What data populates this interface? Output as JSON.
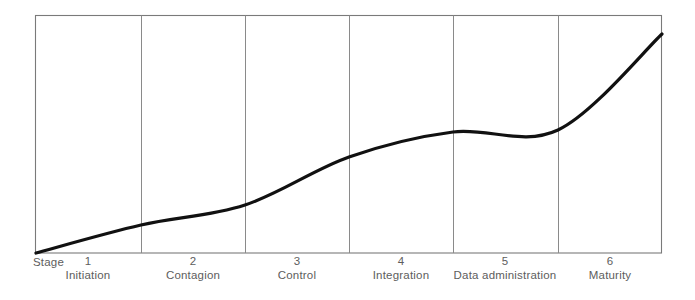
{
  "chart_data": {
    "type": "line",
    "title": "",
    "subtitle": "",
    "xlabel": "Stage",
    "ylabel": "",
    "grid": "vertical-stage-dividers",
    "legend": "none",
    "axis_label_prefix": "Stage",
    "categories": [
      "Initiation",
      "Contagion",
      "Control",
      "Integration",
      "Data administration",
      "Maturity"
    ],
    "stage_numbers": [
      "1",
      "2",
      "3",
      "4",
      "5",
      "6"
    ],
    "xlim": [
      0,
      6
    ],
    "ylim": [
      0,
      100
    ],
    "series": [
      {
        "name": "Growth / expenditure curve",
        "x": [
          0.0,
          1.0,
          2.0,
          3.0,
          4.0,
          5.0,
          6.0
        ],
        "values": [
          0,
          12,
          20,
          40,
          51,
          52,
          92
        ]
      }
    ],
    "curve_points_px": [
      [
        36,
        253
      ],
      [
        141,
        225
      ],
      [
        245,
        205
      ],
      [
        349,
        157
      ],
      [
        453,
        132
      ],
      [
        558,
        130
      ],
      [
        662,
        34
      ]
    ],
    "frame": {
      "left": 35,
      "right": 662,
      "top": 15,
      "bottom": 253
    },
    "dividers_px": [
      141,
      245,
      349,
      453,
      558
    ],
    "colors": {
      "curve": "#111111",
      "frame": "#7a7a7a",
      "divider": "#8a8a8a",
      "text": "#5d5d5d",
      "background": "#ffffff"
    }
  },
  "ticks": [
    {
      "number": "1",
      "name": "Initiation",
      "center_px": 88
    },
    {
      "number": "2",
      "name": "Contagion",
      "center_px": 193
    },
    {
      "number": "3",
      "name": "Control",
      "center_px": 297
    },
    {
      "number": "4",
      "name": "Integration",
      "center_px": 401
    },
    {
      "number": "5",
      "name": "Data administration",
      "center_px": 505
    },
    {
      "number": "6",
      "name": "Maturity",
      "center_px": 610
    }
  ]
}
